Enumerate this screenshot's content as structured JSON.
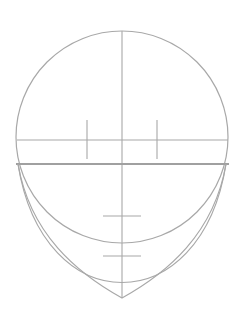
{
  "diagram": {
    "type": "face-proportion-guide",
    "canvas": {
      "width": 245,
      "height": 322,
      "background": "#ffffff"
    },
    "stroke_color": "#a8a8a8",
    "thick_stroke_color": "#a0a0a0",
    "cranium_circle": {
      "cx": 122,
      "cy": 137,
      "r": 106
    },
    "center_line": {
      "x": 122,
      "y1": 31,
      "y2": 298
    },
    "eye_line": {
      "y": 140,
      "x1": 17,
      "x2": 228
    },
    "eye_markers": [
      {
        "x": 87,
        "y1": 120,
        "y2": 159
      },
      {
        "x": 157,
        "y1": 120,
        "y2": 159
      }
    ],
    "jaw_line": {
      "y": 164,
      "x1": 16,
      "x2": 229
    },
    "inner_jaw_arc": {
      "start": [
        18,
        164
      ],
      "bottom": [
        122,
        248
      ],
      "end": [
        226,
        164
      ]
    },
    "chin_outline": {
      "start": [
        18,
        164
      ],
      "chin": [
        122,
        298
      ],
      "end": [
        226,
        164
      ]
    },
    "nose_line": {
      "y": 216,
      "x1": 103,
      "x2": 141
    },
    "mouth_line": {
      "y": 256,
      "x1": 103,
      "x2": 141
    }
  }
}
